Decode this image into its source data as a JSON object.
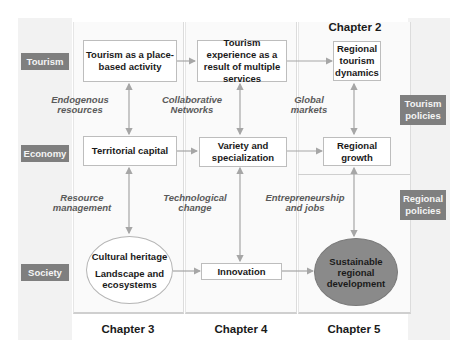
{
  "rows": {
    "tourism": "Tourism",
    "economy": "Economy",
    "society": "Society"
  },
  "policies": {
    "tourism": "Tourism policies",
    "regional": "Regional policies"
  },
  "chapters": {
    "ch2": "Chapter 2",
    "ch3": "Chapter 3",
    "ch4": "Chapter 4",
    "ch5": "Chapter 5"
  },
  "nodes": {
    "place_based": "Tourism as a place-based activity",
    "experience": "Tourism experience as a result of multiple services",
    "regional_dynamics": "Regional tourism dynamics",
    "territorial_capital": "Territorial capital",
    "variety": "Variety and specialization",
    "regional_growth": "Regional growth",
    "cultural_heritage": "Cultural heritage",
    "landscape": "Landscape and ecosystems",
    "innovation": "Innovation",
    "sustainable": "Sustainable regional development"
  },
  "links": {
    "endogenous": "Endogenous resources",
    "collaborative": "Collaborative Networks",
    "global_markets": "Global markets",
    "resource_management": "Resource management",
    "technological_change": "Technological change",
    "entrepreneurship": "Entrepreneurship and jobs"
  },
  "colors": {
    "label_bg": "#7f7f7f",
    "panel_bg": "#f2f2f2",
    "circle_dark": "#8a8a8a",
    "arrow": "#a6a6a6"
  }
}
